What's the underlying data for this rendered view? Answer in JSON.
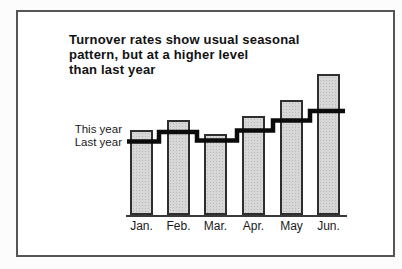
{
  "figure": {
    "title_lines": [
      "Turnover rates show usual seasonal",
      "pattern, but at a higher level",
      "than last year"
    ],
    "series_labels": {
      "this_year": "This year",
      "last_year": "Last year"
    }
  },
  "chart_data": {
    "type": "bar",
    "title": "Turnover rates show usual seasonal pattern, but at a higher level than last year",
    "categories": [
      "Jan.",
      "Feb.",
      "Mar.",
      "Apr.",
      "May",
      "Jun."
    ],
    "series": [
      {
        "name": "This year",
        "style": "bar",
        "values": [
          85,
          95,
          81,
          99,
          115,
          141
        ]
      },
      {
        "name": "Last year",
        "style": "step-line",
        "values": [
          73.5,
          83,
          74.5,
          84.5,
          94.5,
          104
        ]
      }
    ],
    "xlabel": "",
    "ylabel": "",
    "value_units": "relative height (no numeric value axis shown in figure)",
    "ylim": [
      0,
      150
    ],
    "grid": false,
    "legend_position": "left-of-first-bar",
    "colors": {
      "bar_fill": "#d7d7d7",
      "bar_border": "#2e2e2e",
      "step_line": "#0b0b0b",
      "axis": "#3a3a3a",
      "frame_border": "#555555",
      "background": "#ffffff"
    }
  }
}
